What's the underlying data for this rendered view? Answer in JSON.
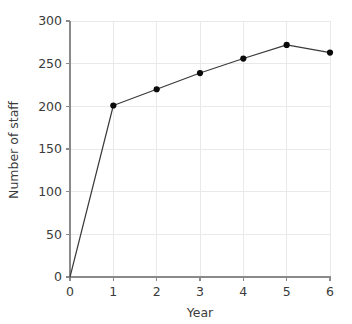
{
  "chart_data": {
    "type": "line",
    "title": "",
    "subtitle": "",
    "xlabel": "Year",
    "ylabel": "Number of staff",
    "x": [
      0,
      1,
      2,
      3,
      4,
      5,
      6
    ],
    "values": [
      0,
      201,
      220,
      239,
      256,
      272,
      263
    ],
    "series": [
      {
        "name": "Number of staff",
        "values": [
          0,
          201,
          220,
          239,
          256,
          272,
          263
        ]
      }
    ],
    "xlim": [
      0,
      6
    ],
    "ylim": [
      0,
      300
    ],
    "xticks": [
      0,
      1,
      2,
      3,
      4,
      5,
      6
    ],
    "yticks": [
      0,
      50,
      100,
      150,
      200,
      250,
      300
    ],
    "xtick_labels": [
      "0",
      "1",
      "2",
      "3",
      "4",
      "5",
      "6"
    ],
    "ytick_labels": [
      "0",
      "50",
      "100",
      "150",
      "200",
      "250",
      "300"
    ],
    "grid": true,
    "grid_axis": "both",
    "legend": false,
    "legend_position": "none",
    "markers": "circle",
    "marker_at_origin": false,
    "annotations": [],
    "colors": {
      "line": "#3a3a3a",
      "marker": "#0a0a0a",
      "grid": "#e9e9e9",
      "axis": "#8a8a8a",
      "text": "#3b3b3b",
      "background": "#ffffff"
    }
  },
  "axes": {
    "x_title": "Year",
    "y_title": "Number of staff"
  }
}
